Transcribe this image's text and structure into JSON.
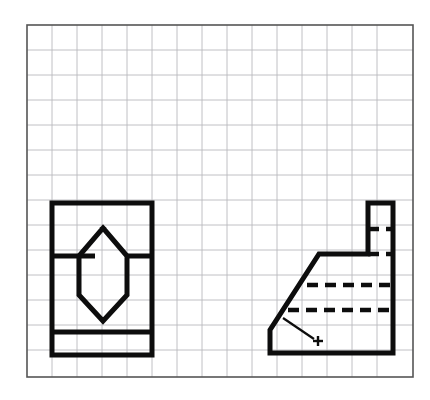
{
  "sheet": {
    "kind": "engineering-sketch-on-grid-paper",
    "background_color": "#ffffff",
    "border": {
      "x": 27,
      "y": 25,
      "width": 386,
      "height": 352,
      "color": "#555555",
      "stroke_width": 1.6
    },
    "grid": {
      "color": "#b9b9bd",
      "stroke_width": 0.9,
      "cell_size": 25,
      "columns": 15,
      "rows": 14,
      "visible": true
    },
    "line_styles": {
      "object_line_color": "#0d0d0d",
      "object_line_width": 5,
      "hidden_line_color": "#0d0d0d",
      "hidden_line_width": 4.6,
      "hidden_dash_pattern": "11 7",
      "leader_line_color": "#0d0d0d",
      "leader_line_width": 2.2
    }
  },
  "views": [
    {
      "id": "front-view",
      "label": "Front view",
      "description": "Rectangle with a hexagonal through hole and a horizontal base rib line",
      "outline": {
        "left": 52,
        "top": 203,
        "right": 152,
        "bottom": 355,
        "points": "52,203 152,203 152,355 52,355 52,203"
      },
      "internal_lines": [
        {
          "name": "upper-break-line-left",
          "points": "52,256 95,256"
        },
        {
          "name": "upper-break-line-right",
          "points": "127,256 152,256"
        },
        {
          "name": "base-rib-line",
          "points": "52,332 152,332"
        }
      ],
      "hexagon_hole": {
        "name": "hexagonal-hole",
        "points": "103,228 127,256 127,295 103,321 79,295 79,256 103,228"
      }
    },
    {
      "id": "side-view",
      "label": "Right side view",
      "description": "Chamfered L-profile with raised boss at top right and two hidden lines",
      "outline": {
        "left": 270,
        "top": 203,
        "right": 393,
        "bottom": 353,
        "points": "270,330 294,305 294,305 270,330 270,353 393,353 393,203 368,203 368,254 319,254 270,330"
      },
      "profile_points": "368,203 393,203 393,353 270,353 270,330 319,254 368,254 368,203",
      "hidden_lines": [
        {
          "name": "hidden-line-boss",
          "points": "368,229 393,229"
        },
        {
          "name": "hidden-line-upper",
          "points": "368,254 393,254"
        },
        {
          "name": "hidden-line-middle",
          "points": "307,285 393,285"
        },
        {
          "name": "hidden-line-lower",
          "points": "288,310 393,310"
        }
      ],
      "leader": {
        "name": "chamfer-leader-line",
        "points": "283,318 314,339",
        "marker": {
          "name": "center-cross-mark",
          "x": 318,
          "y": 341,
          "size": 5
        }
      }
    }
  ]
}
